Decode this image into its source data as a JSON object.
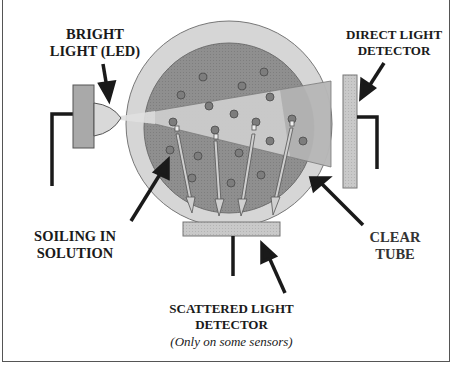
{
  "diagram": {
    "type": "turbidity-sensor-cross-section",
    "labels": {
      "light_source_line1": "BRIGHT",
      "light_source_line2": "LIGHT (LED)",
      "direct_detector_line1": "DIRECT LIGHT",
      "direct_detector_line2": "DETECTOR",
      "soiling_line1": "SOILING IN",
      "soiling_line2": "SOLUTION",
      "tube_line1": "CLEAR",
      "tube_line2": "TUBE",
      "scattered_detector_line1": "SCATTERED LIGHT",
      "scattered_detector_line2": "DETECTOR",
      "scattered_detector_note": "(Only on some sensors)"
    },
    "components": [
      {
        "name": "LED light source",
        "color": "#a9a9a9"
      },
      {
        "name": "Clear tube",
        "color": "#d4d4d4"
      },
      {
        "name": "Solution",
        "color": "#8e8e8e"
      },
      {
        "name": "Light beam",
        "color": "#e4e4e4"
      },
      {
        "name": "Direct light detector",
        "color": "#cfcfcf"
      },
      {
        "name": "Scattered light detector",
        "color": "#bdbdbd"
      },
      {
        "name": "Soil particles",
        "color": "#7a7a7a"
      }
    ],
    "scattered_rays": 4
  }
}
